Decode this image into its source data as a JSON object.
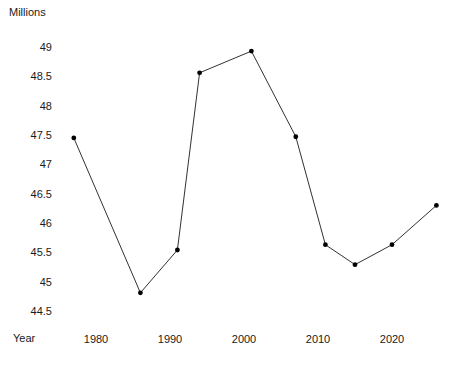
{
  "chart_data": {
    "type": "line",
    "title": "",
    "subtitle": "",
    "xlabel": "Year",
    "ylabel": "Millions",
    "x": [
      1977,
      1986,
      1991,
      1994,
      2001,
      2007,
      2011,
      2015,
      2020,
      2026
    ],
    "values": [
      47.45,
      44.81,
      45.54,
      48.56,
      48.93,
      47.47,
      45.63,
      45.29,
      45.63,
      46.3
    ],
    "series": [
      {
        "name": "Millions",
        "x": [
          1977,
          1986,
          1991,
          1994,
          2001,
          2007,
          2011,
          2015,
          2020,
          2026
        ],
        "values": [
          47.45,
          44.81,
          45.54,
          48.56,
          48.93,
          47.47,
          45.63,
          45.29,
          45.63,
          46.3
        ]
      }
    ],
    "xlim": [
      1974.2,
      2028.3
    ],
    "ylim": [
      44.29,
      49.1
    ],
    "xtick_labels": [
      "1980",
      "1990",
      "2000",
      "2010",
      "2020"
    ],
    "xticks": [
      1980,
      1990,
      2000,
      2010,
      2020
    ],
    "ytick_labels": [
      "49",
      "48.5",
      "48",
      "47.5",
      "47",
      "46.5",
      "46",
      "45.5",
      "45",
      "44.5"
    ],
    "yticks": [
      49,
      48.5,
      48,
      47.5,
      47,
      46.5,
      46,
      45.5,
      45,
      44.5
    ],
    "grid": false,
    "legend": false,
    "legend_position": "none",
    "marker": "circle",
    "line_color": "#1a1a1a",
    "marker_color": "#000000",
    "background_color": "#ffffff",
    "annotations": []
  }
}
